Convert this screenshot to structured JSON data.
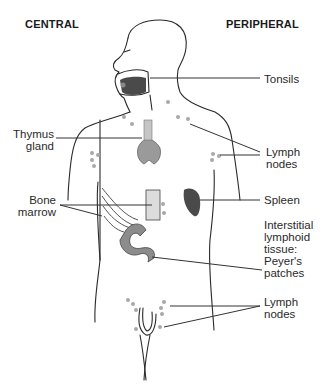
{
  "headers": {
    "central": "CENTRAL",
    "peripheral": "PERIPHERAL"
  },
  "labels": {
    "tonsils": "Tonsils",
    "thymus": [
      "Thymus",
      "gland"
    ],
    "lymph_nodes_upper": [
      "Lymph",
      "nodes"
    ],
    "bone_marrow": [
      "Bone",
      "marrow"
    ],
    "spleen": "Spleen",
    "peyers": [
      "Interstitial",
      "lymphoid",
      "tissue:",
      "Peyer's",
      "patches"
    ],
    "lymph_nodes_lower": [
      "Lymph",
      "nodes"
    ]
  },
  "colors": {
    "outline": "#2a2a2a",
    "organ_dark": "#4a4a4a",
    "organ_gray": "#8c8c8c",
    "node_gray": "#a8a8a8",
    "bone_light": "#d8d8d8"
  }
}
